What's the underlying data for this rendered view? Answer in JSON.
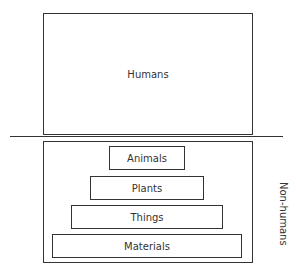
{
  "humans": {
    "label": "Humans"
  },
  "non_humans": {
    "label": "Non-humans",
    "levels": [
      {
        "label": "Animals"
      },
      {
        "label": "Plants"
      },
      {
        "label": "Things"
      },
      {
        "label": "Materials"
      }
    ]
  }
}
